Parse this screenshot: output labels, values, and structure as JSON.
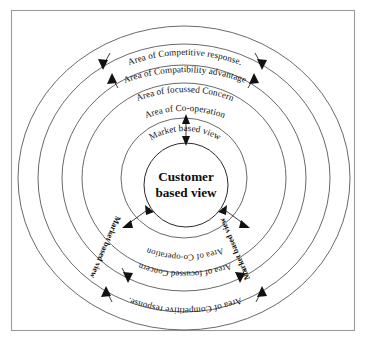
{
  "figure": {
    "center": {
      "line1": "Customer",
      "line2": "based view"
    },
    "rings": [
      {
        "id": "ring-market-based-view",
        "index": 1,
        "label": "Market based view",
        "radius_px": 62
      },
      {
        "id": "ring-co-operation",
        "index": 2,
        "label": "Area of Co-operation",
        "radius_px": 100
      },
      {
        "id": "ring-focussed-concern",
        "index": 3,
        "label": "Area of focussed Concern",
        "radius_px": 120
      },
      {
        "id": "ring-competitive-response",
        "index": 4,
        "label": "Area of Competitive response.",
        "radius_px": 143
      },
      {
        "id": "ring-compatibility-advantage",
        "index": 5,
        "label": "Area of Compatibility advantage",
        "radius_px": 164
      }
    ],
    "top_labels": [
      "Area of Compatibility advantage",
      "Area of Competitive response.",
      "Area of focussed Concern",
      "Area of Co-operation",
      "Market based view"
    ],
    "bottom_labels": [
      "Area of Co-operation",
      "Area of focussed Concern",
      "Area of Competitive response."
    ],
    "side_labels": [
      "Market based view",
      "Market based view"
    ],
    "colors": {
      "line": "#58585c",
      "text": "#111111",
      "frame": "#9a9a9e",
      "background": "#ffffff"
    }
  }
}
